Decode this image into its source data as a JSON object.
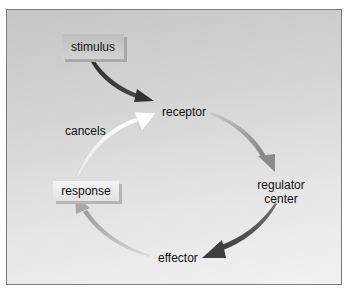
{
  "diagram": {
    "type": "negative-feedback-loop",
    "nodes": {
      "stimulus": "stimulus",
      "receptor": "receptor",
      "regulator_line1": "regulator",
      "regulator_line2": "center",
      "effector": "effector",
      "response": "response"
    },
    "edge_labels": {
      "cancels": "cancels"
    },
    "edges": [
      {
        "from": "stimulus",
        "to": "receptor",
        "color": "#3a3a3a"
      },
      {
        "from": "receptor",
        "to": "regulator center",
        "color": "#9a9a9a"
      },
      {
        "from": "regulator center",
        "to": "effector",
        "color": "#4a4a4a"
      },
      {
        "from": "effector",
        "to": "response",
        "color": "#b0b0b0"
      },
      {
        "from": "response",
        "to": "receptor",
        "label": "cancels",
        "color": "#f6f6f6"
      }
    ],
    "colors": {
      "frame_border": "#7a7a7a",
      "background_top": "#c6c6c6",
      "background_bottom": "#f2f2f2"
    }
  }
}
